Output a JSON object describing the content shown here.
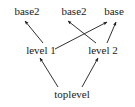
{
  "diagram": {
    "type": "dependency-graph",
    "title": "",
    "background_color": "#ffffff",
    "stroke_color": "#1a1a1a",
    "text_color": "#1a1a1a",
    "nodes": [
      {
        "id": "base2_left",
        "label": "base2",
        "x": 27,
        "y": 11
      },
      {
        "id": "base2_mid",
        "label": "base2",
        "x": 74,
        "y": 11
      },
      {
        "id": "base_right",
        "label": "base",
        "x": 114,
        "y": 11
      },
      {
        "id": "level1",
        "label": "level 1",
        "x": 41,
        "y": 50
      },
      {
        "id": "level2",
        "label": "level 2",
        "x": 103,
        "y": 50
      },
      {
        "id": "toplevel",
        "label": "toplevel",
        "x": 72,
        "y": 94
      }
    ],
    "edges": [
      {
        "from": "level1",
        "to": "base2_left",
        "x1": 43,
        "y1": 43,
        "x2": 25,
        "y2": 21
      },
      {
        "from": "level1",
        "to": "base_right",
        "x1": 55,
        "y1": 49,
        "x2": 107,
        "y2": 22
      },
      {
        "from": "level2",
        "to": "base2_mid",
        "x1": 96,
        "y1": 43,
        "x2": 68,
        "y2": 21
      },
      {
        "from": "level2",
        "to": "base_right",
        "x1": 107,
        "y1": 43,
        "x2": 116,
        "y2": 22
      },
      {
        "from": "toplevel",
        "to": "level1",
        "x1": 58,
        "y1": 87,
        "x2": 40,
        "y2": 58
      },
      {
        "from": "toplevel",
        "to": "level2",
        "x1": 82,
        "y1": 87,
        "x2": 98,
        "y2": 58
      }
    ]
  }
}
